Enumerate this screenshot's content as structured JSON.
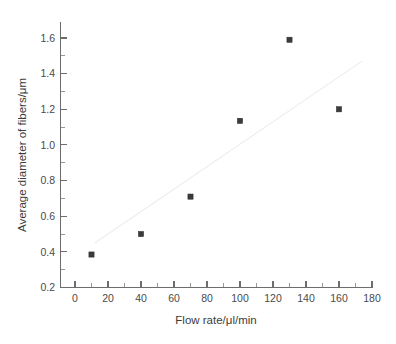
{
  "chart_data": {
    "type": "scatter",
    "title": "",
    "xlabel": "Flow rate/μl/min",
    "ylabel": "Average diameter of fibers/μm",
    "xlim": [
      -10,
      180
    ],
    "ylim": [
      0.2,
      1.68
    ],
    "grid": false,
    "legend": null,
    "x": [
      10,
      40,
      70,
      100,
      130,
      160
    ],
    "y": [
      0.385,
      0.5,
      0.71,
      1.135,
      1.59,
      1.2
    ],
    "series": [
      {
        "name": "Average diameter of fibers",
        "marker": "filled-square",
        "color": "#3b3b3b",
        "points": [
          {
            "x": 10,
            "y": 0.385
          },
          {
            "x": 40,
            "y": 0.5
          },
          {
            "x": 70,
            "y": 0.71
          },
          {
            "x": 100,
            "y": 1.135
          },
          {
            "x": 130,
            "y": 1.59
          },
          {
            "x": 160,
            "y": 1.2
          }
        ]
      },
      {
        "name": "linear fit",
        "type": "line",
        "color": "#ededed",
        "points": [
          {
            "x": 12,
            "y": 0.45
          },
          {
            "x": 174,
            "y": 1.47
          }
        ]
      }
    ],
    "x_ticks": [
      0,
      20,
      40,
      60,
      80,
      100,
      120,
      140,
      160,
      180
    ],
    "x_tick_labels": [
      "0",
      "20",
      "40",
      "60",
      "80",
      "100",
      "120",
      "140",
      "160",
      "180"
    ],
    "y_ticks": [
      0.2,
      0.4,
      0.6,
      0.8,
      1.0,
      1.2,
      1.4,
      1.6
    ],
    "y_tick_labels": [
      "0.2",
      "0.4",
      "0.6",
      "0.8",
      "1.0",
      "1.2",
      "1.4",
      "1.6"
    ],
    "x_minor_step": 10,
    "y_minor_step": 0.1,
    "background_color": "#ffffff",
    "axis_color": "#6d6d6d"
  }
}
